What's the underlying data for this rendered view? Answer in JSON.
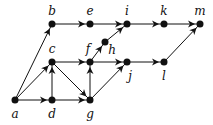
{
  "nodes": [
    {
      "id": "a",
      "x": 15,
      "y": 100,
      "lx": 15,
      "ly": 118
    },
    {
      "id": "b",
      "x": 52,
      "y": 24,
      "lx": 52,
      "ly": 15
    },
    {
      "id": "c",
      "x": 52,
      "y": 62,
      "lx": 52,
      "ly": 53
    },
    {
      "id": "d",
      "x": 52,
      "y": 100,
      "lx": 52,
      "ly": 118
    },
    {
      "id": "e",
      "x": 90,
      "y": 24,
      "lx": 90,
      "ly": 15
    },
    {
      "id": "f",
      "x": 90,
      "y": 62,
      "lx": 88,
      "ly": 53
    },
    {
      "id": "g",
      "x": 90,
      "y": 100,
      "lx": 90,
      "ly": 118
    },
    {
      "id": "h",
      "x": 105,
      "y": 42,
      "lx": 112,
      "ly": 54
    },
    {
      "id": "i",
      "x": 127,
      "y": 24,
      "lx": 127,
      "ly": 15
    },
    {
      "id": "j",
      "x": 127,
      "y": 62,
      "lx": 130,
      "ly": 80
    },
    {
      "id": "k",
      "x": 164,
      "y": 24,
      "lx": 164,
      "ly": 15
    },
    {
      "id": "l",
      "x": 164,
      "y": 62,
      "lx": 164,
      "ly": 80
    },
    {
      "id": "m",
      "x": 200,
      "y": 24,
      "lx": 200,
      "ly": 15
    }
  ],
  "edges": [
    [
      "a",
      "b"
    ],
    [
      "a",
      "c"
    ],
    [
      "a",
      "d"
    ],
    [
      "d",
      "c"
    ],
    [
      "c",
      "f"
    ],
    [
      "c",
      "g"
    ],
    [
      "d",
      "g"
    ],
    [
      "g",
      "f"
    ],
    [
      "g",
      "j"
    ],
    [
      "f",
      "h"
    ],
    [
      "f",
      "j"
    ],
    [
      "h",
      "i"
    ],
    [
      "b",
      "e"
    ],
    [
      "e",
      "i"
    ],
    [
      "i",
      "k"
    ],
    [
      "k",
      "m"
    ],
    [
      "j",
      "l"
    ],
    [
      "l",
      "m"
    ]
  ]
}
